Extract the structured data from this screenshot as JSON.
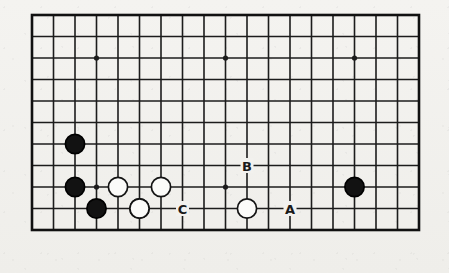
{
  "diagram": {
    "type": "go-board-problem-diagram",
    "board": {
      "style": "partial-board",
      "columns": 19,
      "rows": 11,
      "cell_size": 21.5,
      "origin_x": 32,
      "origin_y": 15,
      "line_color": "#1c1c1c",
      "border_color": "#111111",
      "background_color": "#f2f1ee",
      "line_width": 1.6,
      "border_width": 2.6
    },
    "star_points": [
      {
        "col": 3,
        "row": 2
      },
      {
        "col": 9,
        "row": 2
      },
      {
        "col": 15,
        "row": 2
      },
      {
        "col": 3,
        "row": 8
      },
      {
        "col": 9,
        "row": 8
      }
    ],
    "stones": [
      {
        "color": "black",
        "col": 2,
        "row": 6
      },
      {
        "color": "black",
        "col": 2,
        "row": 8
      },
      {
        "color": "black",
        "col": 3,
        "row": 9
      },
      {
        "color": "black",
        "col": 5,
        "row": 9
      },
      {
        "color": "black",
        "col": 15,
        "row": 8
      },
      {
        "color": "white",
        "col": 4,
        "row": 8
      },
      {
        "color": "white",
        "col": 6,
        "row": 8
      },
      {
        "color": "white",
        "col": 5,
        "row": 9
      },
      {
        "color": "white",
        "col": 10,
        "row": 9
      }
    ],
    "stone_style": {
      "radius": 9.6,
      "black_fill": "#121212",
      "black_stroke": "#000000",
      "white_fill": "#fbfbf9",
      "white_stroke": "#141414",
      "stroke_width": 1.7
    },
    "labels": [
      {
        "text": "A",
        "col": 12,
        "row": 9
      },
      {
        "text": "B",
        "col": 10,
        "row": 7
      },
      {
        "text": "C",
        "col": 7,
        "row": 9
      }
    ],
    "label_color": "#1a1a1a"
  }
}
